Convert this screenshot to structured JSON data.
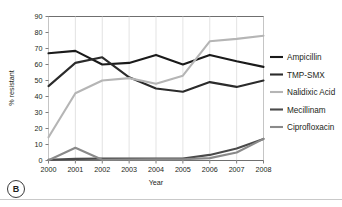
{
  "figure": {
    "panel_letter": "B",
    "panel_letter_name": "panel-label-b"
  },
  "chart_data": {
    "type": "line",
    "title": "",
    "xlabel": "Year",
    "ylabel": "% resistant",
    "categories": [
      2000,
      2001,
      2002,
      2003,
      2004,
      2005,
      2006,
      2007,
      2008
    ],
    "x_tick_labels": [
      "2000",
      "2001",
      "2002",
      "2003",
      "2004",
      "2005",
      "2006",
      "2007",
      "2008"
    ],
    "y_tick_labels": [
      "0",
      "10",
      "20",
      "30",
      "40",
      "50",
      "60",
      "70",
      "80",
      "90"
    ],
    "y_ticks": [
      0,
      10,
      20,
      30,
      40,
      50,
      60,
      70,
      80,
      90
    ],
    "ylim": [
      0,
      90
    ],
    "grid": "vertical",
    "legend_position": "right",
    "series": [
      {
        "name": "Ampicillin",
        "color": "#1a1a1a",
        "width": 2.1,
        "values": [
          67,
          68.5,
          60,
          61,
          66,
          60,
          66,
          62,
          58.5
        ]
      },
      {
        "name": "TMP-SMX",
        "color": "#2b2b2b",
        "width": 2.1,
        "values": [
          46.5,
          61,
          64.5,
          52,
          45,
          43,
          49,
          46,
          50
        ]
      },
      {
        "name": "Nalidixic Acid",
        "color": "#b5b5b5",
        "width": 2.1,
        "values": [
          14.5,
          42,
          50,
          51.5,
          48,
          53,
          74.5,
          76,
          78
        ]
      },
      {
        "name": "Mecillinam",
        "color": "#4a4a4a",
        "width": 2.1,
        "values": [
          0.5,
          1,
          1.2,
          1.2,
          1.2,
          1.2,
          3.5,
          7.5,
          13.5
        ]
      },
      {
        "name": "Ciprofloxacin",
        "color": "#8a8a8a",
        "width": 2.1,
        "values": [
          0.2,
          8,
          0.5,
          0.6,
          0.7,
          0.8,
          1.5,
          5,
          13.5
        ]
      }
    ]
  },
  "colors": {
    "axis": "#6f6f6f",
    "grid": "#dcdcdc",
    "text": "#231f20",
    "rule": "#c9c9c9"
  }
}
